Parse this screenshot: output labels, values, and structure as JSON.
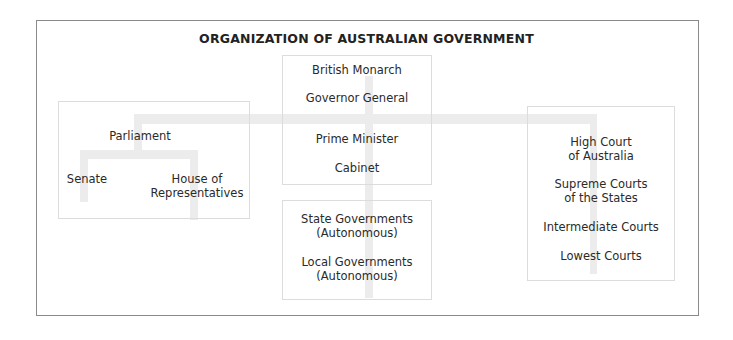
{
  "title": "ORGANIZATION OF AUSTRALIAN GOVERNMENT",
  "nodes": {
    "executive": {
      "british_monarch": "British Monarch",
      "governor_general": "Governor General",
      "prime_minister": "Prime Minister",
      "cabinet": "Cabinet"
    },
    "legislative": {
      "parliament": "Parliament",
      "senate": "Senate",
      "house_line1": "House of",
      "house_line2": "Representatives"
    },
    "subnational": {
      "state_line1": "State Governments",
      "state_line2": "(Autonomous)",
      "local_line1": "Local Governments",
      "local_line2": "(Autonomous)"
    },
    "judicial": {
      "high_court_line1": "High Court",
      "high_court_line2": "of Australia",
      "supreme_line1": "Supreme Courts",
      "supreme_line2": "of the States",
      "intermediate": "Intermediate Courts",
      "lowest": "Lowest Courts"
    }
  },
  "colors": {
    "frame_border": "#8a8a8a",
    "box_border": "#dcdcdc",
    "connector": "#ececec",
    "text": "#2a2a2a"
  }
}
